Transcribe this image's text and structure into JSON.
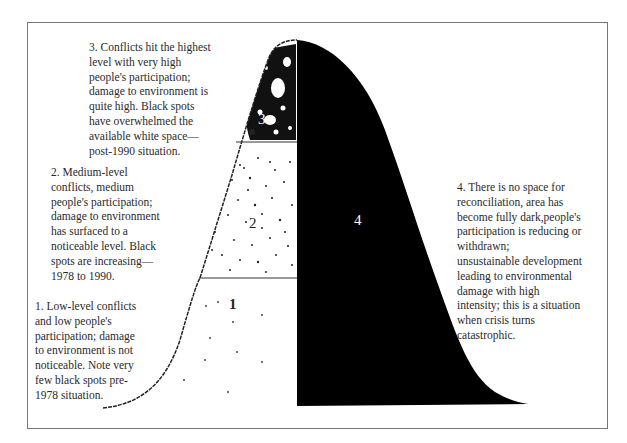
{
  "diagram": {
    "type": "conflict-escalation-bell-curve",
    "stages": [
      {
        "number": "1",
        "label": "1",
        "description": "1. Low-level conflicts and low people's participation; damage to environment is not noticeable. Note very few black spots pre-1978 situation.",
        "lines": [
          "1. Low-level conflicts",
          "and low people's",
          "participation; damage",
          "to environment is not",
          "noticeable. Note very",
          "few black spots pre-",
          "1978 situation."
        ]
      },
      {
        "number": "2",
        "label": "2",
        "description": "2. Medium-level conflicts, medium people's participation; damage to environment has surfaced to a noticeable level. Black spots are increasing—1978 to 1990.",
        "lines": [
          "2. Medium-level",
          "conflicts, medium",
          "people's participation;",
          "damage to environment",
          "has surfaced to a",
          "noticeable level. Black",
          "spots are increasing—",
          "1978 to 1990."
        ]
      },
      {
        "number": "3",
        "label": "3",
        "description": "3. Conflicts hit the highest level with very high people's participation; damage to environment is quite high. Black spots have overwhelmed the available white space—post-1990 situation.",
        "lines": [
          "3. Conflicts hit the highest",
          "level with very high",
          "people's participation;",
          "damage to environment is",
          "quite high. Black spots",
          "have overwhelmed the",
          "available white space—",
          "post-1990 situation."
        ]
      },
      {
        "number": "4",
        "label": "4",
        "description": "4. There is no space for reconciliation, area has become fully dark,people's participation is reducing or withdrawn; unsustainable development leading to environmental damage with high intensity; this is a situation when crisis turns catastrophic.",
        "lines": [
          "4. There is no space for",
          "reconciliation, area has",
          "become fully dark,people's",
          "participation is reducing or",
          "withdrawn;",
          "unsustainable development",
          "leading to environmental",
          "damage with high",
          "intensity; this is a situation",
          "when crisis turns",
          "catastrophic."
        ]
      }
    ],
    "colors": {
      "fill_dark": "#000000",
      "line": "#222222",
      "frame": "#777777",
      "background": "#ffffff"
    }
  }
}
